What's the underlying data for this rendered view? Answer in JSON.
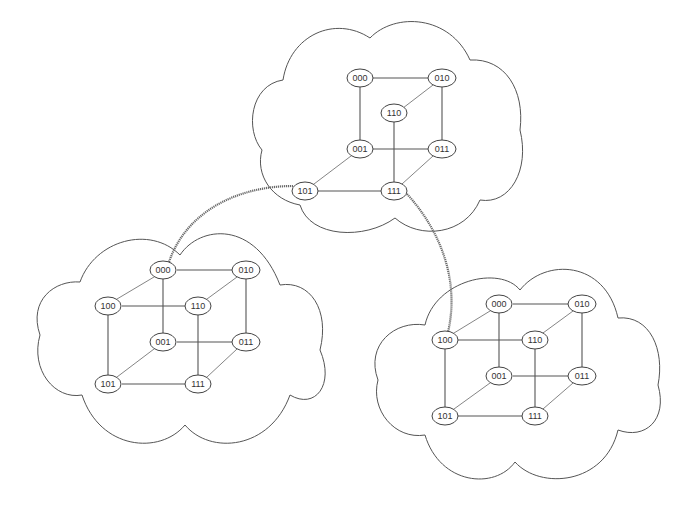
{
  "diagram": {
    "title": "",
    "clouds": [
      {
        "id": "top",
        "nodes": [
          "000",
          "010",
          "110",
          "001",
          "011",
          "101",
          "111"
        ]
      },
      {
        "id": "left",
        "nodes": [
          "000",
          "010",
          "100",
          "110",
          "001",
          "011",
          "101",
          "111"
        ]
      },
      {
        "id": "right",
        "nodes": [
          "000",
          "010",
          "100",
          "110",
          "001",
          "011",
          "101",
          "111"
        ]
      }
    ],
    "inter_cloud_links": [
      {
        "from": "top.101",
        "to": "left.000"
      },
      {
        "from": "top.111",
        "to": "right.100"
      }
    ],
    "labels": {
      "top": {
        "n000": "000",
        "n010": "010",
        "n110": "110",
        "n001": "001",
        "n011": "011",
        "n101": "101",
        "n111": "111"
      },
      "left": {
        "n000": "000",
        "n010": "010",
        "n100": "100",
        "n110": "110",
        "n001": "001",
        "n011": "011",
        "n101": "101",
        "n111": "111"
      },
      "right": {
        "n000": "000",
        "n010": "010",
        "n100": "100",
        "n110": "110",
        "n001": "001",
        "n011": "011",
        "n101": "101",
        "n111": "111"
      }
    },
    "colors": {
      "stroke": "#555555",
      "background": "#ffffff",
      "link": "#6a6a6a"
    }
  }
}
